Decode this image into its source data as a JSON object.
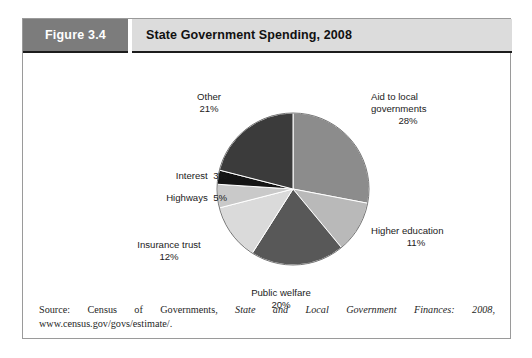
{
  "figure": {
    "number_label": "Figure 3.4",
    "title": "State Government Spending, 2008"
  },
  "source": {
    "prefix": "Source: Census of Governments, ",
    "italic_part": "State and Local Government Finances: 2008",
    "suffix": ", www.census.gov/govs/estimate/."
  },
  "chart_data": {
    "type": "pie",
    "title": "State Government Spending, 2008",
    "subtitle": "",
    "xlabel": "",
    "ylabel": "",
    "legend_position": "none",
    "grid": false,
    "units": "percent",
    "total": 100,
    "start_angle_deg": 0,
    "direction": "clockwise",
    "categories": [
      "Aid to local governments",
      "Higher education",
      "Public welfare",
      "Insurance trust",
      "Highways",
      "Interest",
      "Other"
    ],
    "values": [
      28,
      11,
      20,
      12,
      5,
      3,
      21
    ],
    "slices": [
      {
        "label": "Aid to local governments",
        "label_line1": "Aid to local",
        "label_line2": "governments",
        "value": 28,
        "pct_text": "28%",
        "color": "#8c8c8c"
      },
      {
        "label": "Higher education",
        "label_line1": "Higher education",
        "label_line2": "",
        "value": 11,
        "pct_text": "11%",
        "color": "#b9b9b9"
      },
      {
        "label": "Public welfare",
        "label_line1": "Public welfare",
        "label_line2": "",
        "value": 20,
        "pct_text": "20%",
        "color": "#585858"
      },
      {
        "label": "Insurance trust",
        "label_line1": "Insurance trust",
        "label_line2": "",
        "value": 12,
        "pct_text": "12%",
        "color": "#dadada"
      },
      {
        "label": "Highways",
        "label_line1": "Highways",
        "label_line2": "",
        "value": 5,
        "pct_text": "5%",
        "color": "#c9c9c9"
      },
      {
        "label": "Interest",
        "label_line1": "Interest",
        "label_line2": "",
        "value": 3,
        "pct_text": "3%",
        "color": "#141414"
      },
      {
        "label": "Other",
        "label_line1": "Other",
        "label_line2": "",
        "value": 21,
        "pct_text": "21%",
        "color": "#3b3b3b"
      }
    ]
  },
  "colors": {
    "figure_number_bg": "#7c7c7c",
    "figure_title_bg": "#dcdcdc",
    "frame_border": "#9a9a9a",
    "header_underline": "#1c1c1c",
    "slice_separator": "#ffffff",
    "pie_outline": "#555555"
  }
}
